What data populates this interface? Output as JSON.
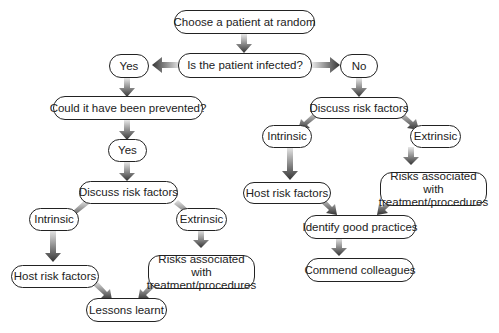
{
  "diagram": {
    "type": "flowchart",
    "nodes": {
      "start": "Choose a patient at random",
      "question": "Is the patient infected?",
      "yes": "Yes",
      "no": "No",
      "prevented": "Could it have been prevented?",
      "prevented_yes": "Yes",
      "left_discuss": "Discuss risk factors",
      "left_intrinsic": "Intrinsic",
      "left_extrinsic": "Extrinsic",
      "left_host": "Host risk factors",
      "left_risks": "Risks associated with treatment/procedures",
      "lessons": "Lessons learnt",
      "right_discuss": "Discuss risk factors",
      "right_intrinsic": "Intrinsic",
      "right_extrinsic": "Extrinsic",
      "right_host": "Host risk factors",
      "right_risks": "Risks associated with treatment/procedures",
      "good_practices": "Identify good practices",
      "commend": "Commend colleagues"
    },
    "edges": [
      [
        "start",
        "question"
      ],
      [
        "question",
        "yes"
      ],
      [
        "question",
        "no"
      ],
      [
        "yes",
        "prevented"
      ],
      [
        "prevented",
        "prevented_yes"
      ],
      [
        "prevented_yes",
        "left_discuss"
      ],
      [
        "left_discuss",
        "left_intrinsic"
      ],
      [
        "left_discuss",
        "left_extrinsic"
      ],
      [
        "left_intrinsic",
        "left_host"
      ],
      [
        "left_extrinsic",
        "left_risks"
      ],
      [
        "left_host",
        "lessons"
      ],
      [
        "left_risks",
        "lessons"
      ],
      [
        "no",
        "right_discuss"
      ],
      [
        "right_discuss",
        "right_intrinsic"
      ],
      [
        "right_discuss",
        "right_extrinsic"
      ],
      [
        "right_intrinsic",
        "right_host"
      ],
      [
        "right_extrinsic",
        "right_risks"
      ],
      [
        "right_host",
        "good_practices"
      ],
      [
        "right_risks",
        "good_practices"
      ],
      [
        "good_practices",
        "commend"
      ]
    ]
  }
}
